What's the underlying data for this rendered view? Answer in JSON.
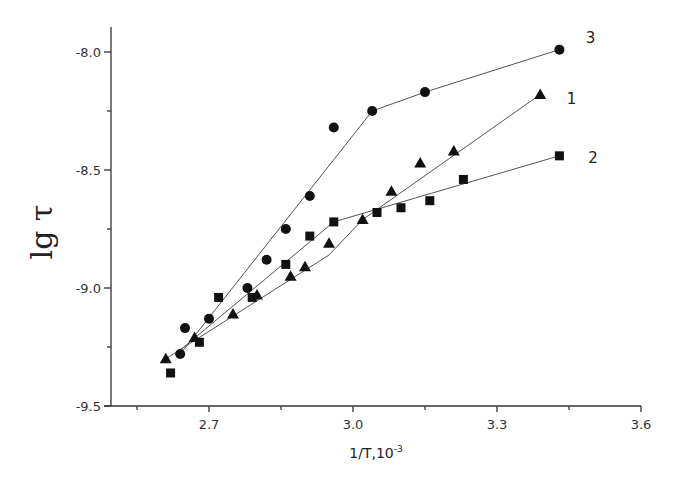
{
  "chart_data": {
    "type": "scatter",
    "title": "",
    "xlabel": "1/T,10",
    "xlabel_superscript": "-3",
    "ylabel": "lg τ",
    "xlim": [
      2.55,
      3.6
    ],
    "ylim": [
      -9.5,
      -7.9
    ],
    "x_ticks": [
      2.7,
      3.0,
      3.3,
      3.6
    ],
    "x_tick_labels": [
      "2.7",
      "3.0",
      "3.3",
      "3.6"
    ],
    "x_minor_ticks": [
      2.55,
      2.85,
      3.15,
      3.45
    ],
    "y_ticks": [
      -8.0,
      -8.5,
      -9.0,
      -9.5
    ],
    "y_tick_labels": [
      "-8.0",
      "-8.5",
      "-9.0",
      "-9.5"
    ],
    "y_minor_ticks": [
      -8.25,
      -8.75,
      -9.25
    ],
    "grid": false,
    "legend": "inline labels at line ends",
    "series": [
      {
        "name": "1",
        "marker": "triangle",
        "x": [
          2.61,
          2.67,
          2.75,
          2.8,
          2.87,
          2.9,
          2.95,
          3.02,
          3.08,
          3.14,
          3.21,
          3.39
        ],
        "y": [
          -9.3,
          -9.21,
          -9.11,
          -9.03,
          -8.95,
          -8.91,
          -8.81,
          -8.71,
          -8.59,
          -8.47,
          -8.42,
          -8.18
        ],
        "fit_line": {
          "x": [
            2.61,
            2.95,
            3.02,
            3.39
          ],
          "y": [
            -9.3,
            -8.86,
            -8.71,
            -8.18
          ]
        },
        "label_pos": {
          "x": 3.455,
          "y": -8.22
        }
      },
      {
        "name": "2",
        "marker": "square",
        "x": [
          2.62,
          2.68,
          2.72,
          2.79,
          2.86,
          2.91,
          2.96,
          3.05,
          3.1,
          3.16,
          3.23,
          3.43
        ],
        "y": [
          -9.36,
          -9.23,
          -9.04,
          -9.04,
          -8.9,
          -8.78,
          -8.72,
          -8.68,
          -8.66,
          -8.63,
          -8.54,
          -8.44
        ],
        "fit_line": {
          "x": [
            2.63,
            2.96,
            3.43
          ],
          "y": [
            -9.28,
            -8.72,
            -8.44
          ]
        },
        "label_pos": {
          "x": 3.5,
          "y": -8.47
        }
      },
      {
        "name": "3",
        "marker": "circle",
        "x": [
          2.64,
          2.65,
          2.7,
          2.78,
          2.82,
          2.86,
          2.91,
          2.96,
          3.04,
          3.15,
          3.43
        ],
        "y": [
          -9.28,
          -9.17,
          -9.13,
          -9.0,
          -8.88,
          -8.75,
          -8.61,
          -8.32,
          -8.25,
          -8.17,
          -7.99
        ],
        "fit_line": {
          "x": [
            2.64,
            3.04,
            3.15,
            3.43
          ],
          "y": [
            -9.28,
            -8.25,
            -8.17,
            -7.99
          ]
        },
        "label_pos": {
          "x": 3.495,
          "y": -7.96
        }
      }
    ]
  }
}
